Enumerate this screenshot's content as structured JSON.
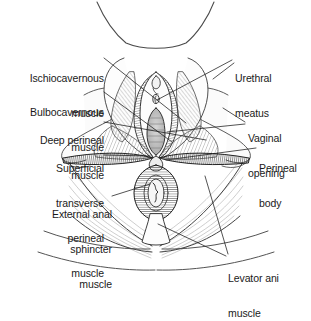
{
  "figure": {
    "view": "lithotomy position, inferior view",
    "background_color": "#ffffff",
    "ink_color": "#1a1a1a"
  },
  "labels": {
    "ischiocavernous": {
      "line1": "Ischiocavernous",
      "line2": "muscle"
    },
    "bulbocavernous": {
      "line1": "Bulbocavernous",
      "line2": "muscle"
    },
    "deep_perineal": {
      "line1": "Deep perineal",
      "line2": "muscle"
    },
    "superficial_transverse_perineal": {
      "line1": "Superficial",
      "line2": "transverse",
      "line3": "perineal",
      "line4": "muscle"
    },
    "external_anal_sphincter": {
      "line1": "External anal",
      "line2": "sphincter",
      "line3": "muscle"
    },
    "urethral_meatus": {
      "line1": "Urethral",
      "line2": "meatus"
    },
    "vaginal_opening": {
      "line1": "Vaginal",
      "line2": "opening"
    },
    "perineal_body": {
      "line1": "Perineal",
      "line2": "body"
    },
    "levator_ani": {
      "line1": "Levator ani",
      "line2": "muscle"
    }
  },
  "structures": [
    {
      "name": "mons-pubis-outline",
      "side": "superior"
    },
    {
      "name": "labia-majora",
      "side": "bilateral"
    },
    {
      "name": "labia-minora",
      "side": "bilateral"
    },
    {
      "name": "clitoris",
      "side": "midline"
    },
    {
      "name": "urethral-meatus",
      "side": "midline"
    },
    {
      "name": "vaginal-opening",
      "side": "midline"
    },
    {
      "name": "perineal-body",
      "side": "midline"
    },
    {
      "name": "anus",
      "side": "midline"
    },
    {
      "name": "ischiocavernous-muscle",
      "side": "bilateral"
    },
    {
      "name": "bulbocavernous-muscle",
      "side": "bilateral"
    },
    {
      "name": "deep-perineal-muscle",
      "side": "bilateral"
    },
    {
      "name": "superficial-transverse-perineal-muscle",
      "side": "bilateral"
    },
    {
      "name": "external-anal-sphincter-muscle",
      "side": "midline"
    },
    {
      "name": "levator-ani-muscle",
      "side": "bilateral"
    },
    {
      "name": "gluteal-fold",
      "side": "bilateral"
    },
    {
      "name": "coccyx",
      "side": "midline"
    }
  ]
}
